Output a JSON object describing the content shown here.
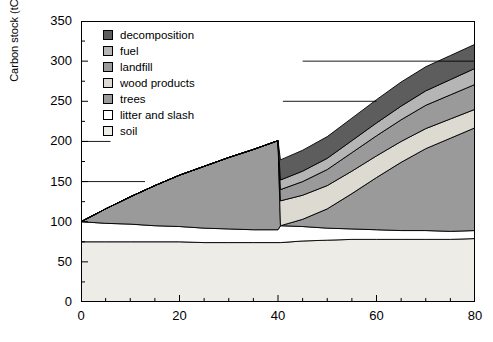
{
  "chart_data": {
    "type": "area",
    "stacked": true,
    "title": "",
    "xlabel": "",
    "ylabel": "Carbon stock (tC.hm-2)",
    "ylabel_base": "Carbon stock (tC.hm",
    "ylabel_sup": "-2",
    "ylabel_close": ")",
    "xlim": [
      0,
      80
    ],
    "ylim": [
      0,
      350
    ],
    "yticks": [
      0,
      50,
      100,
      150,
      200,
      250,
      300,
      350
    ],
    "xticks": [
      0,
      20,
      40,
      60,
      80
    ],
    "x_minor_step": 5,
    "y_minor_step": 25,
    "grid": false,
    "legend_position": "upper-left-inside",
    "reference_lines": [
      {
        "value": 150,
        "x_start": 0,
        "x_end": 13
      },
      {
        "value": 200,
        "x_start": 0,
        "x_end": 6
      },
      {
        "value": 250,
        "x_start": 41,
        "x_end": 60
      },
      {
        "value": 300,
        "x_start": 45,
        "x_end": 80
      }
    ],
    "harvest_year": 40,
    "x": [
      0,
      5,
      10,
      15,
      20,
      25,
      30,
      35,
      40,
      40.5,
      45,
      50,
      55,
      60,
      65,
      70,
      75,
      80
    ],
    "series": [
      {
        "name": "soil",
        "color": "#eeece7",
        "values": [
          75,
          75,
          75,
          75,
          75,
          74,
          74,
          74,
          74,
          74,
          76,
          77,
          78,
          78,
          78,
          78,
          78,
          79
        ]
      },
      {
        "name": "litter and slash",
        "color": "#ffffff",
        "values": [
          25,
          23,
          22,
          20,
          19,
          18,
          17,
          16,
          16,
          21,
          18,
          15,
          13,
          12,
          11,
          11,
          10,
          10
        ]
      },
      {
        "name": "trees",
        "color": "#9a9a9a",
        "values": [
          0,
          18,
          34,
          50,
          64,
          77,
          89,
          100,
          111,
          0,
          9,
          24,
          44,
          65,
          85,
          102,
          116,
          128
        ]
      },
      {
        "name": "wood products",
        "color": "#dddad2",
        "values": [
          0,
          0,
          0,
          0,
          0,
          0,
          0,
          0,
          0,
          31,
          30,
          29,
          28,
          27,
          26,
          25,
          24,
          23
        ]
      },
      {
        "name": "landfill",
        "color": "#9a9a9a",
        "values": [
          0,
          0,
          0,
          0,
          0,
          0,
          0,
          0,
          0,
          14,
          17,
          20,
          23,
          25,
          27,
          29,
          30,
          31
        ]
      },
      {
        "name": "fuel",
        "color": "#b5b5b5",
        "values": [
          0,
          0,
          0,
          0,
          0,
          0,
          0,
          0,
          0,
          12,
          13,
          14,
          15,
          16,
          17,
          18,
          19,
          20
        ]
      },
      {
        "name": "decomposition",
        "color": "#5d5d5d",
        "values": [
          0,
          0,
          0,
          0,
          0,
          0,
          0,
          0,
          0,
          25,
          26,
          27,
          28,
          29,
          30,
          30,
          30,
          30
        ]
      }
    ],
    "legend_entries": [
      {
        "label": "decomposition",
        "color": "#5d5d5d"
      },
      {
        "label": "fuel",
        "color": "#b5b5b5"
      },
      {
        "label": "landfill",
        "color": "#9a9a9a"
      },
      {
        "label": "wood products",
        "color": "#dddad2"
      },
      {
        "label": "trees",
        "color": "#9a9a9a"
      },
      {
        "label": "litter and slash",
        "color": "#ffffff"
      },
      {
        "label": "soil",
        "color": "#eeece7"
      }
    ]
  }
}
